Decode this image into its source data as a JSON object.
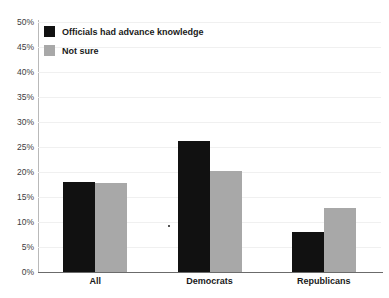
{
  "chart_data": {
    "type": "bar",
    "title": "",
    "xlabel": "",
    "ylabel": "",
    "ylim": [
      0,
      50
    ],
    "ytick_step": 5,
    "grid": true,
    "legend_position": "top-left",
    "categories": [
      "All",
      "Democrats",
      "Republicans"
    ],
    "ytick_labels": [
      "50%",
      "45%",
      "40%",
      "35%",
      "30%",
      "25%",
      "20%",
      "15%",
      "10%",
      "5%",
      "0%"
    ],
    "ytick_values": [
      50,
      45,
      40,
      35,
      30,
      25,
      20,
      15,
      10,
      5,
      0
    ],
    "series": [
      {
        "name": "Officials had advance knowledge",
        "color": "#111111",
        "values": [
          18.0,
          26.3,
          8.0
        ]
      },
      {
        "name": "Not sure",
        "color": "#a8a8a8",
        "values": [
          17.8,
          20.2,
          12.8
        ]
      }
    ]
  },
  "axis": {
    "y_axis_color": "#b9b9b9",
    "x_axis_color": "#6b6b6b",
    "gridline_color": "#f0f0f0"
  }
}
